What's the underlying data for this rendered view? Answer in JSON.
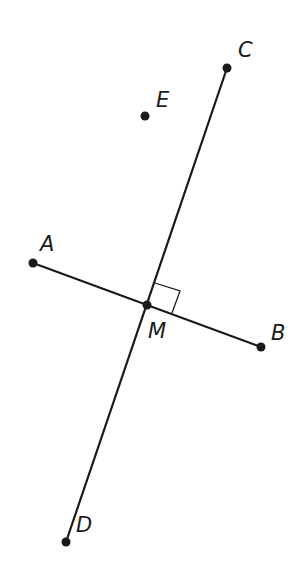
{
  "diagram": {
    "type": "geometry-perpendicular-bisector",
    "colors": {
      "ink": "#1a1a1a",
      "background": "#ffffff"
    },
    "points": {
      "A": {
        "label": "A",
        "x": 33,
        "y": 263
      },
      "B": {
        "label": "B",
        "x": 261,
        "y": 347
      },
      "C": {
        "label": "C",
        "x": 227,
        "y": 68
      },
      "D": {
        "label": "D",
        "x": 66,
        "y": 542
      },
      "E": {
        "label": "E",
        "x": 145,
        "y": 116
      },
      "M": {
        "label": "M",
        "x": 147,
        "y": 305
      }
    },
    "segments": [
      {
        "from": "A",
        "to": "B",
        "name": "segment-AB"
      },
      {
        "from": "C",
        "to": "D",
        "name": "line-CD"
      }
    ],
    "annotations": {
      "right_angle_at": "M",
      "right_angle_marker": "square"
    }
  }
}
